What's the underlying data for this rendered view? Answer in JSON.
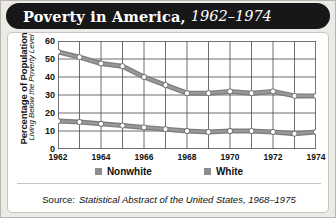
{
  "title": {
    "main": "Poverty in America,",
    "years": "1962–1974"
  },
  "axes": {
    "y_title_line1": "Percentage of Population",
    "y_title_line2": "Living Below the Poverty Level",
    "y_ticks": [
      "0",
      "10",
      "20",
      "30",
      "40",
      "50",
      "60"
    ],
    "x_ticks": [
      "1962",
      "1964",
      "1966",
      "1968",
      "1970",
      "1972",
      "1974"
    ]
  },
  "legend": {
    "items": [
      {
        "label": "Nonwhite",
        "color": "#8c8c8c"
      },
      {
        "label": "White",
        "color": "#8c8c8c"
      }
    ]
  },
  "source": {
    "prefix": "Source:",
    "citation": "Statistical Abstract of the United States, 1968–1975"
  },
  "colors": {
    "banner": "#171717",
    "card": "#ffffff",
    "page": "#eceae6",
    "line": "#7f7f7f",
    "grid": "#4a4a4a",
    "marker_fill": "#ffffff"
  },
  "chart_data": {
    "type": "line",
    "title": "Poverty in America, 1962–1974",
    "xlabel": "",
    "ylabel": "Percentage of Population Living Below the Poverty Level",
    "x": [
      1962,
      1963,
      1964,
      1965,
      1966,
      1967,
      1968,
      1969,
      1970,
      1971,
      1972,
      1973,
      1974
    ],
    "xlim": [
      1962,
      1974
    ],
    "ylim": [
      0,
      60
    ],
    "ytick_step": 10,
    "grid": true,
    "legend_position": "bottom",
    "series": [
      {
        "name": "Nonwhite",
        "values": [
          54,
          51,
          47.5,
          46,
          40,
          35.5,
          31,
          31,
          32,
          31,
          32,
          29.5,
          29.5
        ]
      },
      {
        "name": "White",
        "values": [
          15.5,
          15,
          14,
          13,
          12,
          11,
          10,
          9.5,
          10,
          10,
          9.5,
          8.5,
          9.5
        ]
      }
    ]
  }
}
